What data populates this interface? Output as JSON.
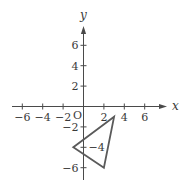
{
  "diagram": {
    "type": "coordinate-plane",
    "axes": {
      "x_label": "x",
      "y_label": "y",
      "origin_label": "O",
      "x_ticks": [
        {
          "value": -6,
          "label": "−6"
        },
        {
          "value": -4,
          "label": "−4"
        },
        {
          "value": -2,
          "label": "−2"
        },
        {
          "value": 2,
          "label": "2"
        },
        {
          "value": 4,
          "label": "4"
        },
        {
          "value": 6,
          "label": "6"
        }
      ],
      "y_ticks": [
        {
          "value": 6,
          "label": "6"
        },
        {
          "value": 4,
          "label": "4"
        },
        {
          "value": 2,
          "label": "2"
        },
        {
          "value": -2,
          "label": "−2"
        },
        {
          "value": -4,
          "label": "−4"
        },
        {
          "value": -6,
          "label": "−6"
        }
      ],
      "x_range": [
        -7,
        8
      ],
      "y_range": [
        -7,
        8
      ]
    },
    "triangle": {
      "vertices": [
        [
          3,
          -1
        ],
        [
          -1,
          -4
        ],
        [
          2,
          -6
        ]
      ],
      "stroke_color": "#5a5a5a"
    },
    "colors": {
      "axis": "#4a4a4a",
      "text": "#3a3a3a",
      "background": "#ffffff"
    }
  }
}
